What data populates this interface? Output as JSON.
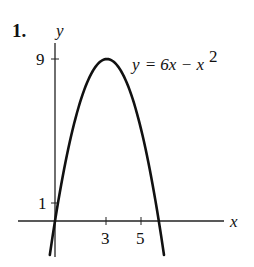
{
  "problem_number": "1.",
  "chart_data": {
    "type": "line",
    "title": "",
    "equation_label": {
      "lhs": "y",
      "rhs": "= 6x − x",
      "exponent": "2"
    },
    "xlabel": "x",
    "ylabel": "y",
    "x_ticks": [
      {
        "value": 3,
        "label": "3"
      },
      {
        "value": 5,
        "label": "5"
      }
    ],
    "y_ticks": [
      {
        "value": 1,
        "label": "1"
      },
      {
        "value": 9,
        "label": "9"
      }
    ],
    "xlim": [
      -2.2,
      9.9
    ],
    "ylim": [
      -2.0,
      10.0
    ],
    "grid": false,
    "legend": "none",
    "series": [
      {
        "name": "y = 6x - x^2",
        "function": "6x - x^2",
        "x": [
          -0.3,
          0,
          1,
          2,
          3,
          4,
          5,
          6,
          6.3
        ],
        "y": [
          -1.89,
          0,
          5,
          8,
          9,
          8,
          5,
          0,
          -1.89
        ]
      }
    ],
    "colors": {
      "curve": "#111111",
      "axes": "#222222"
    }
  }
}
